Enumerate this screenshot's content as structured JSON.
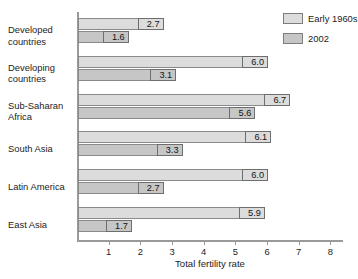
{
  "chart_data": {
    "type": "bar",
    "orientation": "horizontal",
    "title": "",
    "xlabel": "Total fertility rate",
    "ylabel": "",
    "xlim": [
      0,
      8.4
    ],
    "xticks": [
      1,
      2,
      3,
      4,
      5,
      6,
      7,
      8
    ],
    "xtick_labels": [
      "1",
      "2",
      "3",
      "4",
      "5",
      "6",
      "7",
      "8"
    ],
    "grid": false,
    "legend_position": "top-right",
    "categories": [
      "Developed\ncountries",
      "Developing\ncountries",
      "Sub-Saharan\nAfrica",
      "South Asia",
      "Latin America",
      "East Asia"
    ],
    "series": [
      {
        "name": "Early 1960s",
        "color": "#dcdcdc",
        "values": [
          2.7,
          6.0,
          6.7,
          6.1,
          6.0,
          5.9
        ],
        "labels": [
          "2.7",
          "6.0",
          "6.7",
          "6.1",
          "6.0",
          "5.9"
        ]
      },
      {
        "name": "2002",
        "color": "#c6c6c6",
        "values": [
          1.6,
          3.1,
          5.6,
          3.3,
          2.7,
          1.7
        ],
        "labels": [
          "1.6",
          "3.1",
          "5.6",
          "3.3",
          "2.7",
          "1.7"
        ]
      }
    ]
  },
  "legend": {
    "items": [
      {
        "label": "Early 1960s"
      },
      {
        "label": "2002"
      }
    ]
  },
  "axis": {
    "x_title": "Total fertility rate"
  }
}
